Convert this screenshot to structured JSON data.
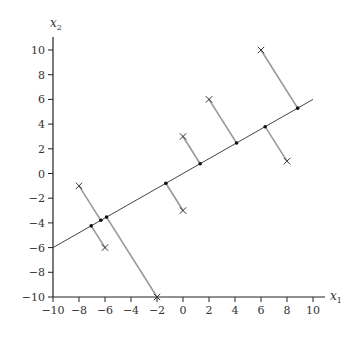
{
  "chart_data": {
    "type": "scatter",
    "title": "",
    "xlabel": "x",
    "xlabel_sub": "1",
    "ylabel": "x",
    "ylabel_sub": "2",
    "xlim": [
      -10,
      10
    ],
    "ylim": [
      -10,
      10
    ],
    "xticks": [
      -10,
      -8,
      -6,
      -4,
      -2,
      0,
      2,
      4,
      6,
      8,
      10
    ],
    "yticks": [
      -10,
      -8,
      -6,
      -4,
      -2,
      0,
      2,
      4,
      6,
      8,
      10
    ],
    "grid": false,
    "line": {
      "name": "projection-line",
      "slope": 0.6,
      "intercept": 0,
      "x_range": [
        -10,
        10
      ]
    },
    "points": [
      {
        "x": -8,
        "y": -1,
        "proj_x": -6.32,
        "proj_y": -3.79
      },
      {
        "x": -6,
        "y": -6,
        "proj_x": -7.06,
        "proj_y": -4.24
      },
      {
        "x": -2,
        "y": -10,
        "proj_x": -5.88,
        "proj_y": -3.53
      },
      {
        "x": 0,
        "y": -3,
        "proj_x": -1.32,
        "proj_y": -0.79
      },
      {
        "x": 0,
        "y": 3,
        "proj_x": 1.32,
        "proj_y": 0.79
      },
      {
        "x": 2,
        "y": 6,
        "proj_x": 4.12,
        "proj_y": 2.47
      },
      {
        "x": 6,
        "y": 10,
        "proj_x": 8.82,
        "proj_y": 5.29
      },
      {
        "x": 8,
        "y": 1,
        "proj_x": 6.32,
        "proj_y": 3.79
      }
    ],
    "colors": {
      "axis": "#222222",
      "line": "#444444",
      "projection": "#999999",
      "marker": "#333333"
    }
  }
}
